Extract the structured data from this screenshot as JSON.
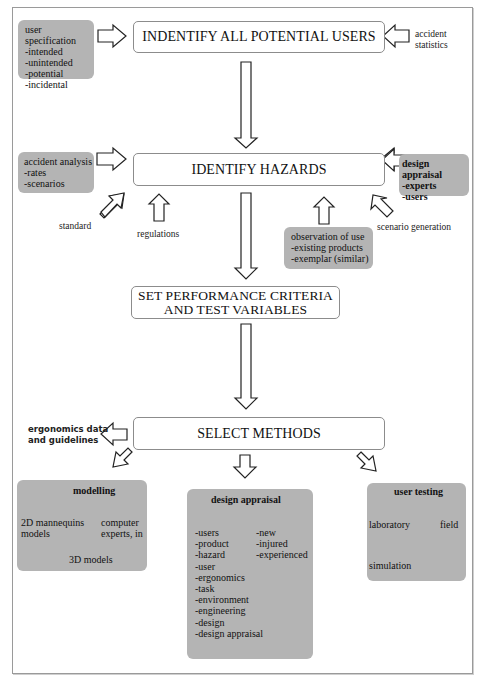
{
  "stages": {
    "identify_users": "INDENTIFY ALL POTENTIAL USERS",
    "identify_hazards": "IDENTIFY HAZARDS",
    "performance_line1": "SET PERFORMANCE CRITERIA",
    "performance_line2": "AND TEST VARIABLES",
    "select_methods": "SELECT METHODS"
  },
  "inputs": {
    "user_specification": {
      "title": "user specification",
      "items": [
        "-intended",
        "-unintended",
        "-potential",
        "-incidental"
      ]
    },
    "accident_statistics": {
      "line1": "accident",
      "line2": "statistics"
    },
    "accident_analysis": {
      "title": "accident analysis",
      "items": [
        "-rates",
        "-scenarios"
      ]
    },
    "standard": "standard",
    "regulations": "regulations",
    "design_appraisal_input": {
      "title": "design appraisal",
      "items": [
        "-experts",
        "-users"
      ]
    },
    "scenario_generation": "scenario generation",
    "observation_of_use": {
      "title": "observation of use",
      "items": [
        "-existing products",
        "-exemplar (similar)"
      ]
    },
    "ergonomics_data": {
      "line1": "ergonomics data",
      "line2": "and guidelines"
    }
  },
  "methods": {
    "modelling": {
      "title": "modelling",
      "left": {
        "line1": "2D mannequins",
        "line2": "models"
      },
      "right": {
        "line1": "computer",
        "line2": "experts, in"
      },
      "bottom": "3D models"
    },
    "design_appraisal": {
      "title": "design appraisal",
      "left_items": [
        "-users",
        "-product",
        "-hazard",
        "-user",
        "-ergonomics",
        "-task",
        "-environment",
        "-engineering",
        "-design",
        "-design appraisal"
      ],
      "right_items": [
        "-new",
        "-injured",
        "-experienced"
      ]
    },
    "user_testing": {
      "title": "user testing",
      "left": "laboratory",
      "right": "field",
      "bottom": "simulation"
    }
  },
  "colors": {
    "grey_box": "#b4b4b4",
    "stage_border": "#8c8c8c",
    "arrow_stroke": "#222222",
    "frame_border": "#9a9a9a"
  }
}
